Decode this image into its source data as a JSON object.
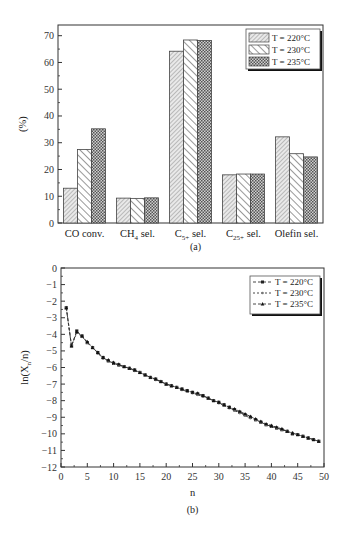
{
  "chart_data": [
    {
      "type": "bar",
      "panel_label": "(a)",
      "title": "",
      "xlabel": "",
      "ylabel": "(%)",
      "ylim": [
        0,
        70
      ],
      "yticks": [
        0,
        10,
        20,
        30,
        40,
        50,
        60,
        70
      ],
      "categories": [
        "CO conv.",
        "CH4 sel.",
        "C5+ sel.",
        "C25+ sel.",
        "Olefin sel."
      ],
      "category_labels": [
        {
          "main": "CO conv.",
          "sub": "",
          "rest": ""
        },
        {
          "main": "CH",
          "sub": "4",
          "rest": " sel."
        },
        {
          "main": "C",
          "sub": "5+",
          "rest": " sel."
        },
        {
          "main": "C",
          "sub": "25+",
          "rest": " sel."
        },
        {
          "main": "Olefin sel.",
          "sub": "",
          "rest": ""
        }
      ],
      "series": [
        {
          "name": "T = 220°C",
          "pattern": "fine-diagonal",
          "values": [
            13.0,
            9.3,
            64.2,
            18.0,
            32.2
          ]
        },
        {
          "name": "T = 230°C",
          "pattern": "wide-diagonal",
          "values": [
            27.5,
            9.2,
            68.4,
            18.3,
            25.9
          ]
        },
        {
          "name": "T = 235°C",
          "pattern": "crosshatch",
          "values": [
            35.2,
            9.4,
            68.2,
            18.3,
            24.7
          ]
        }
      ],
      "legend_position": "top-right",
      "grid": false
    },
    {
      "type": "line",
      "panel_label": "(b)",
      "title": "",
      "xlabel": "n",
      "ylabel": "ln(Xn/n)",
      "xlim": [
        0,
        50
      ],
      "ylim": [
        -12,
        0
      ],
      "xticks": [
        0,
        5,
        10,
        15,
        20,
        25,
        30,
        35,
        40,
        45,
        50
      ],
      "yticks": [
        0,
        -1,
        -2,
        -3,
        -4,
        -5,
        -6,
        -7,
        -8,
        -9,
        -10,
        -11,
        -12
      ],
      "x": [
        1,
        2,
        3,
        4,
        5,
        6,
        7,
        8,
        9,
        10,
        11,
        12,
        13,
        14,
        15,
        16,
        17,
        18,
        19,
        20,
        21,
        22,
        23,
        24,
        25,
        26,
        27,
        28,
        29,
        30,
        31,
        32,
        33,
        34,
        35,
        36,
        37,
        38,
        39,
        40,
        41,
        42,
        43,
        44,
        45,
        46,
        47,
        48,
        49
      ],
      "series": [
        {
          "name": "T = 220°C",
          "marker": "square",
          "values": [
            -2.4,
            -4.7,
            -3.8,
            -4.1,
            -4.5,
            -4.8,
            -5.1,
            -5.4,
            -5.6,
            -5.75,
            -5.85,
            -5.95,
            -6.05,
            -6.15,
            -6.3,
            -6.45,
            -6.6,
            -6.7,
            -6.85,
            -7.0,
            -7.1,
            -7.2,
            -7.3,
            -7.4,
            -7.5,
            -7.6,
            -7.7,
            -7.85,
            -8.0,
            -8.1,
            -8.25,
            -8.4,
            -8.55,
            -8.7,
            -8.85,
            -9.0,
            -9.15,
            -9.3,
            -9.45,
            -9.55,
            -9.65,
            -9.75,
            -9.85,
            -10.0,
            -10.05,
            -10.15,
            -10.25,
            -10.35,
            -10.45
          ]
        },
        {
          "name": "T = 230°C",
          "marker": "circle",
          "values": [
            -2.4,
            -4.7,
            -3.9,
            -4.15,
            -4.5,
            -4.8,
            -5.15,
            -5.45,
            -5.6,
            -5.75,
            -5.85,
            -5.95,
            -6.05,
            -6.2,
            -6.3,
            -6.45,
            -6.6,
            -6.75,
            -6.85,
            -7.0,
            -7.1,
            -7.2,
            -7.35,
            -7.45,
            -7.55,
            -7.65,
            -7.75,
            -7.85,
            -8.0,
            -8.15,
            -8.3,
            -8.45,
            -8.6,
            -8.75,
            -8.9,
            -9.05,
            -9.15,
            -9.3,
            -9.45,
            -9.55,
            -9.65,
            -9.75,
            -9.85,
            -9.95,
            -10.05,
            -10.15,
            -10.25,
            -10.35,
            -10.45
          ]
        },
        {
          "name": "T = 235°C",
          "marker": "triangle",
          "values": [
            -2.4,
            -4.7,
            -3.85,
            -4.1,
            -4.45,
            -4.8,
            -5.1,
            -5.4,
            -5.55,
            -5.7,
            -5.8,
            -5.95,
            -6.05,
            -6.15,
            -6.3,
            -6.45,
            -6.6,
            -6.7,
            -6.85,
            -7.0,
            -7.1,
            -7.2,
            -7.3,
            -7.4,
            -7.5,
            -7.55,
            -7.7,
            -7.85,
            -8.0,
            -8.1,
            -8.25,
            -8.4,
            -8.5,
            -8.65,
            -8.8,
            -8.95,
            -9.1,
            -9.25,
            -9.4,
            -9.5,
            -9.6,
            -9.7,
            -9.85,
            -9.95,
            -10.05,
            -10.15,
            -10.25,
            -10.35,
            -10.45
          ]
        }
      ],
      "legend_position": "top-right",
      "grid": false
    }
  ]
}
